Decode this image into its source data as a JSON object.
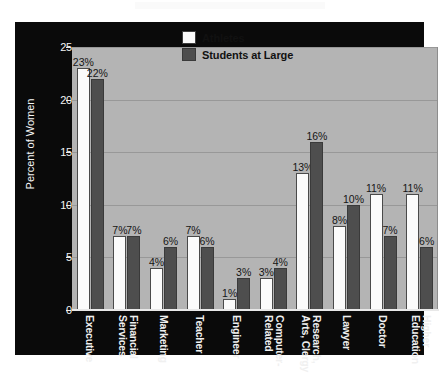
{
  "chart_data": {
    "type": "bar",
    "title": "",
    "xlabel": "",
    "ylabel": "Percent of Women",
    "ylim": [
      0,
      25
    ],
    "yticks": [
      0,
      5,
      10,
      15,
      20,
      25
    ],
    "ytick_labels": [
      "0",
      "5",
      "10",
      "15",
      "20",
      "25"
    ],
    "grid": true,
    "grid_axis": "y",
    "legend_position": "top-center",
    "value_label_suffix": "%",
    "categories": [
      "Executive",
      "Financial Services",
      "Marketing",
      "Teacher",
      "Engineer",
      "Computer-Related",
      "Research, Arts, Clergy",
      "Lawyer",
      "Doctor",
      "Higher Education"
    ],
    "category_lines": [
      [
        "Executive",
        ""
      ],
      [
        "Financial",
        "Services"
      ],
      [
        "Marketing",
        ""
      ],
      [
        "Teacher",
        ""
      ],
      [
        "Engineer",
        ""
      ],
      [
        "Computer-",
        "Related"
      ],
      [
        "Research,",
        "Arts, Clergy"
      ],
      [
        "Lawyer",
        ""
      ],
      [
        "Doctor",
        ""
      ],
      [
        "Higher",
        "Education"
      ]
    ],
    "series": [
      {
        "name": "Athletes",
        "color": "#fbfbfb",
        "values": [
          23,
          7,
          4,
          7,
          1,
          3,
          13,
          8,
          11,
          11
        ],
        "labels": [
          "23%",
          "7%",
          "4%",
          "7%",
          "1%",
          "3%",
          "13%",
          "8%",
          "11%",
          "11%"
        ]
      },
      {
        "name": "Students at Large",
        "color": "#4e4e4e",
        "values": [
          22,
          7,
          6,
          6,
          3,
          4,
          16,
          10,
          7,
          6
        ],
        "labels": [
          "22%",
          "7%",
          "6%",
          "6%",
          "3%",
          "4%",
          "16%",
          "10%",
          "7%",
          "6%"
        ]
      }
    ]
  },
  "legend": {
    "items": [
      {
        "label": "Athletes",
        "swatch": "athletes"
      },
      {
        "label": "Students at Large",
        "swatch": "students"
      }
    ]
  },
  "colors": {
    "panel_background": "#0a0a0a",
    "plot_background": "#b4b4b4",
    "gridline": "#989898",
    "axis_text": "#f2f2f2",
    "value_text": "#141414",
    "athletes_bar": "#fbfbfb",
    "students_bar": "#4e4e4e"
  }
}
